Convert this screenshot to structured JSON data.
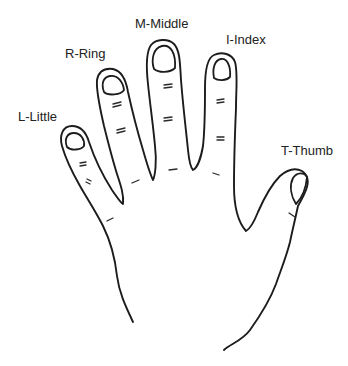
{
  "diagram": {
    "type": "hand-finger-labels",
    "colors": {
      "line": "#1c1c1c",
      "text": "#222222",
      "background": "#ffffff"
    },
    "labels": {
      "middle": "M-Middle",
      "index": "I-Index",
      "ring": "R-Ring",
      "little": "L-Little",
      "thumb": "T-Thumb"
    }
  }
}
